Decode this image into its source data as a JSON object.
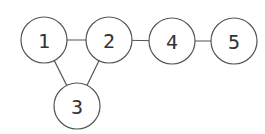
{
  "diagram": {
    "type": "undirected-graph",
    "stroke_color": "#555555",
    "label_color": "#333333",
    "node_radius": 23,
    "nodes": [
      {
        "id": "1",
        "label": "1",
        "cx": 44,
        "cy": 40
      },
      {
        "id": "2",
        "label": "2",
        "cx": 109,
        "cy": 40
      },
      {
        "id": "3",
        "label": "3",
        "cx": 77,
        "cy": 106
      },
      {
        "id": "4",
        "label": "4",
        "cx": 172,
        "cy": 41
      },
      {
        "id": "5",
        "label": "5",
        "cx": 234,
        "cy": 41
      }
    ],
    "edges": [
      {
        "from": "1",
        "to": "2"
      },
      {
        "from": "2",
        "to": "4"
      },
      {
        "from": "4",
        "to": "5"
      },
      {
        "from": "1",
        "to": "3"
      },
      {
        "from": "2",
        "to": "3"
      }
    ]
  }
}
